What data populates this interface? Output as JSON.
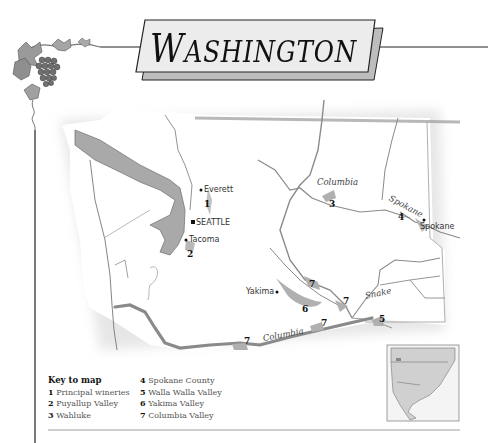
{
  "header": {
    "title": "WASHINGTON",
    "title_initial": "W",
    "title_rest": "ASHINGTON"
  },
  "cities": {
    "everett": "Everett",
    "seattle": "SEATTLE",
    "tacoma": "Tacoma",
    "yakima": "Yakima",
    "spokane": "Spokane"
  },
  "rivers": {
    "columbia_north": "Columbia",
    "spokane": "Spokane",
    "snake": "Snake",
    "columbia_south": "Columbia"
  },
  "region_markers": [
    {
      "id": "1",
      "x": 205,
      "y": 202
    },
    {
      "id": "2",
      "x": 188,
      "y": 252
    },
    {
      "id": "3",
      "x": 330,
      "y": 202
    },
    {
      "id": "4",
      "x": 398,
      "y": 216
    },
    {
      "id": "5",
      "x": 380,
      "y": 318
    },
    {
      "id": "6",
      "x": 303,
      "y": 307
    },
    {
      "id": "7a",
      "x": 337,
      "y": 281
    },
    {
      "id": "7b",
      "x": 343,
      "y": 299
    },
    {
      "id": "7c",
      "x": 321,
      "y": 320
    },
    {
      "id": "7d",
      "x": 244,
      "y": 339
    }
  ],
  "marker_labels": {
    "m1": "1",
    "m2": "2",
    "m3": "3",
    "m4": "4",
    "m5": "5",
    "m6": "6",
    "m7": "7"
  },
  "key": {
    "heading": "Key to map",
    "items": [
      {
        "num": "1",
        "label": "Principal wineries"
      },
      {
        "num": "2",
        "label": "Puyallup Valley"
      },
      {
        "num": "3",
        "label": "Wahluke"
      },
      {
        "num": "4",
        "label": "Spokane County"
      },
      {
        "num": "5",
        "label": "Walla Walla Valley"
      },
      {
        "num": "6",
        "label": "Yakima Valley"
      },
      {
        "num": "7",
        "label": "Columbia Valley"
      }
    ]
  },
  "inset": {
    "name": "North America locator"
  },
  "colors": {
    "water": "#a9a9a9",
    "region": "#b5b5b5",
    "border": "#888888",
    "river": "#8a8a8a",
    "title_box": "#ececec",
    "title_shadow": "#bdbdbd"
  }
}
